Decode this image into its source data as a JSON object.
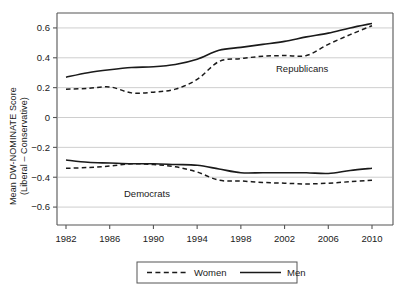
{
  "axis": {
    "y_title_line1": "Mean DW-NOMINATE Score",
    "y_title_line2": "(Liberal – Conservative)",
    "y_ticks": [
      "0.6",
      "0.4",
      "0.2",
      "0",
      "−0.2",
      "−0.4",
      "−0.6"
    ],
    "x_ticks": [
      "1982",
      "1986",
      "1990",
      "1994",
      "1998",
      "2002",
      "2006",
      "2010"
    ]
  },
  "annotations": {
    "republicans": "Republicans",
    "democrats": "Democrats"
  },
  "legend": {
    "women": "Women",
    "men": "Men"
  },
  "colors": {
    "line": "#1a1a1a",
    "grid": "#c8c8c8",
    "frame": "#555555",
    "background": "#ffffff"
  },
  "chart_data": {
    "type": "line",
    "title": "",
    "xlabel": "",
    "ylabel": "Mean DW-NOMINATE Score (Liberal – Conservative)",
    "xlim": [
      1982,
      2010
    ],
    "ylim": [
      -0.72,
      0.7
    ],
    "yticks": [
      0.6,
      0.4,
      0.2,
      0,
      -0.2,
      -0.4,
      -0.6
    ],
    "xticks": [
      1982,
      1986,
      1990,
      1994,
      1998,
      2002,
      2006,
      2010
    ],
    "grid": "horizontal",
    "legend_position": "bottom-outside",
    "x": [
      1982,
      1984,
      1986,
      1988,
      1990,
      1992,
      1994,
      1996,
      1998,
      2000,
      2002,
      2004,
      2006,
      2008,
      2010
    ],
    "series": [
      {
        "name": "Men",
        "group": "Republicans",
        "style": "solid",
        "values": [
          0.27,
          0.3,
          0.32,
          0.335,
          0.34,
          0.355,
          0.39,
          0.45,
          0.47,
          0.49,
          0.51,
          0.54,
          0.565,
          0.6,
          0.63
        ]
      },
      {
        "name": "Women",
        "group": "Republicans",
        "style": "dashed",
        "values": [
          0.19,
          0.195,
          0.205,
          0.165,
          0.17,
          0.19,
          0.255,
          0.375,
          0.395,
          0.41,
          0.415,
          0.415,
          0.49,
          0.555,
          0.615
        ]
      },
      {
        "name": "Men",
        "group": "Democrats",
        "style": "solid",
        "values": [
          -0.285,
          -0.3,
          -0.305,
          -0.31,
          -0.31,
          -0.315,
          -0.32,
          -0.345,
          -0.37,
          -0.37,
          -0.37,
          -0.37,
          -0.375,
          -0.355,
          -0.34
        ]
      },
      {
        "name": "Women",
        "group": "Democrats",
        "style": "dashed",
        "values": [
          -0.34,
          -0.335,
          -0.325,
          -0.31,
          -0.315,
          -0.33,
          -0.365,
          -0.42,
          -0.425,
          -0.435,
          -0.44,
          -0.445,
          -0.44,
          -0.43,
          -0.42
        ]
      }
    ]
  }
}
